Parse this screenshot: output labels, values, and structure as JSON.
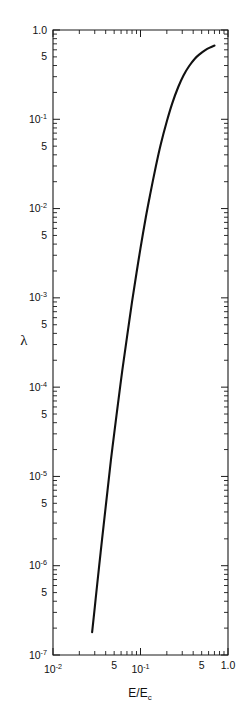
{
  "chart_data": {
    "type": "line",
    "title": "",
    "subtitle": "",
    "xlabel": "E/E_c",
    "xlabel_main": "E/E",
    "xlabel_sub": "c",
    "ylabel": "λ",
    "xscale": "log",
    "yscale": "log",
    "xlim": [
      0.01,
      1.0
    ],
    "ylim": [
      1e-07,
      1.0
    ],
    "grid": false,
    "legend": null,
    "annotations": [],
    "x_tick_labels": [
      {
        "value": 0.01,
        "text": "10",
        "exponent": "-2"
      },
      {
        "value": 0.05,
        "text": "5",
        "exponent": ""
      },
      {
        "value": 0.1,
        "text": "10",
        "exponent": "-1"
      },
      {
        "value": 0.5,
        "text": "5",
        "exponent": ""
      },
      {
        "value": 1.0,
        "text": "1.0",
        "exponent": ""
      }
    ],
    "y_tick_labels": [
      {
        "value": 1.0,
        "text": "1.0",
        "exponent": ""
      },
      {
        "value": 0.5,
        "text": "5",
        "exponent": ""
      },
      {
        "value": 0.1,
        "text": "10",
        "exponent": "-1"
      },
      {
        "value": 0.05,
        "text": "5",
        "exponent": ""
      },
      {
        "value": 0.01,
        "text": "10",
        "exponent": "-2"
      },
      {
        "value": 0.005,
        "text": "5",
        "exponent": ""
      },
      {
        "value": 0.001,
        "text": "10",
        "exponent": "-3"
      },
      {
        "value": 0.0005,
        "text": "5",
        "exponent": ""
      },
      {
        "value": 0.0001,
        "text": "10",
        "exponent": "-4"
      },
      {
        "value": 5e-05,
        "text": "5",
        "exponent": ""
      },
      {
        "value": 1e-05,
        "text": "10",
        "exponent": "-5"
      },
      {
        "value": 5e-06,
        "text": "5",
        "exponent": ""
      },
      {
        "value": 1e-06,
        "text": "10",
        "exponent": "-6"
      },
      {
        "value": 5e-07,
        "text": "5",
        "exponent": ""
      },
      {
        "value": 1e-07,
        "text": "10",
        "exponent": "-7"
      }
    ],
    "series": [
      {
        "name": "lambda vs E/Ec",
        "x": [
          0.028,
          0.03,
          0.032,
          0.035,
          0.038,
          0.042,
          0.046,
          0.05,
          0.056,
          0.062,
          0.07,
          0.08,
          0.09,
          0.1,
          0.115,
          0.13,
          0.15,
          0.17,
          0.2,
          0.23,
          0.27,
          0.31,
          0.36,
          0.42,
          0.48,
          0.55,
          0.62,
          0.7
        ],
        "y": [
          1.8e-07,
          3.4e-07,
          6.2e-07,
          1.4e-06,
          2.9e-06,
          7e-06,
          1.55e-05,
          3e-05,
          7.2e-05,
          0.000155,
          0.00036,
          0.0009,
          0.0019,
          0.0036,
          0.008,
          0.015,
          0.03,
          0.052,
          0.095,
          0.15,
          0.23,
          0.31,
          0.395,
          0.48,
          0.54,
          0.595,
          0.635,
          0.67
        ]
      }
    ]
  },
  "figure": {
    "background_color": "#ffffff",
    "line_color": "#111111",
    "axis_color": "#1a1a1a"
  }
}
